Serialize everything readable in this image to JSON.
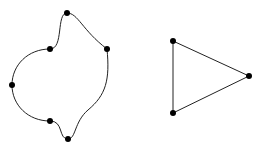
{
  "diagram": {
    "type": "graph-drawings",
    "colors": {
      "edge": "#222222",
      "vertex": "#000000",
      "background": "#ffffff"
    },
    "graphs": [
      {
        "name": "curved-cycle-6",
        "vertices": [
          {
            "id": "a",
            "x": 67,
            "y": 13
          },
          {
            "id": "b",
            "x": 107,
            "y": 49
          },
          {
            "id": "c",
            "x": 68,
            "y": 139
          },
          {
            "id": "d",
            "x": 50,
            "y": 121
          },
          {
            "id": "e",
            "x": 12,
            "y": 85
          },
          {
            "id": "f",
            "x": 50,
            "y": 49
          }
        ]
      },
      {
        "name": "triangle",
        "vertices": [
          {
            "id": "p",
            "x": 173,
            "y": 41
          },
          {
            "id": "q",
            "x": 249,
            "y": 76
          },
          {
            "id": "r",
            "x": 173,
            "y": 113
          }
        ],
        "edges": [
          [
            "p",
            "q"
          ],
          [
            "q",
            "r"
          ],
          [
            "r",
            "p"
          ]
        ]
      }
    ]
  }
}
